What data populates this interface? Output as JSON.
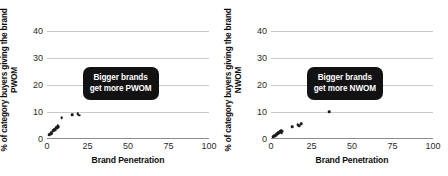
{
  "panels": [
    {
      "id": "pwom",
      "ylabel": "% of category buyers giving the brand PWOM",
      "xlabel": "Brand Penetration",
      "callout_line1": "Bigger brands",
      "callout_line2": "get more PWOM",
      "chart_data": {
        "type": "scatter",
        "title": "",
        "xlabel": "Brand Penetration",
        "ylabel": "% of category buyers giving the brand PWOM",
        "xlim": [
          0,
          100
        ],
        "ylim": [
          0,
          44
        ],
        "xticks": [
          0,
          25,
          50,
          75,
          100
        ],
        "yticks": [
          0,
          10,
          20,
          30,
          40
        ],
        "grid": true,
        "legend": null,
        "annotation": "Bigger brands get more PWOM",
        "points": [
          {
            "x": 1.5,
            "y": 1.5
          },
          {
            "x": 2.0,
            "y": 1.8
          },
          {
            "x": 2.6,
            "y": 2.2
          },
          {
            "x": 3.0,
            "y": 2.0
          },
          {
            "x": 3.4,
            "y": 2.8
          },
          {
            "x": 3.8,
            "y": 3.2
          },
          {
            "x": 4.2,
            "y": 3.0
          },
          {
            "x": 4.6,
            "y": 3.6
          },
          {
            "x": 5.0,
            "y": 3.4
          },
          {
            "x": 5.4,
            "y": 4.0
          },
          {
            "x": 5.8,
            "y": 4.4
          },
          {
            "x": 6.2,
            "y": 4.2
          },
          {
            "x": 6.6,
            "y": 4.8
          },
          {
            "x": 7.0,
            "y": 4.6
          },
          {
            "x": 9.0,
            "y": 7.8
          },
          {
            "x": 15.5,
            "y": 9.0
          },
          {
            "x": 19.0,
            "y": 9.4
          },
          {
            "x": 20.0,
            "y": 8.8
          },
          {
            "x": 36.0,
            "y": 18.8
          }
        ]
      }
    },
    {
      "id": "nwom",
      "ylabel": "% of category buyers giving the brand NWOM",
      "xlabel": "Brand Penetration",
      "callout_line1": "Bigger brands",
      "callout_line2": "get more NWOM",
      "chart_data": {
        "type": "scatter",
        "title": "",
        "xlabel": "Brand Penetration",
        "ylabel": "% of category buyers giving the brand NWOM",
        "xlim": [
          0,
          100
        ],
        "ylim": [
          0,
          44
        ],
        "xticks": [
          0,
          25,
          50,
          75,
          100
        ],
        "yticks": [
          0,
          10,
          20,
          30,
          40
        ],
        "grid": true,
        "legend": null,
        "annotation": "Bigger brands get more NWOM",
        "points": [
          {
            "x": 1.5,
            "y": 0.8
          },
          {
            "x": 2.0,
            "y": 1.2
          },
          {
            "x": 2.6,
            "y": 1.0
          },
          {
            "x": 3.0,
            "y": 1.6
          },
          {
            "x": 3.4,
            "y": 1.4
          },
          {
            "x": 3.8,
            "y": 2.0
          },
          {
            "x": 4.2,
            "y": 1.8
          },
          {
            "x": 4.6,
            "y": 2.4
          },
          {
            "x": 5.0,
            "y": 2.2
          },
          {
            "x": 5.4,
            "y": 2.8
          },
          {
            "x": 5.8,
            "y": 2.6
          },
          {
            "x": 6.2,
            "y": 3.0
          },
          {
            "x": 6.6,
            "y": 2.4
          },
          {
            "x": 7.0,
            "y": 2.8
          },
          {
            "x": 13.0,
            "y": 4.6
          },
          {
            "x": 16.5,
            "y": 5.2
          },
          {
            "x": 17.5,
            "y": 4.8
          },
          {
            "x": 18.5,
            "y": 5.6
          },
          {
            "x": 36.0,
            "y": 10.0
          }
        ]
      }
    }
  ]
}
